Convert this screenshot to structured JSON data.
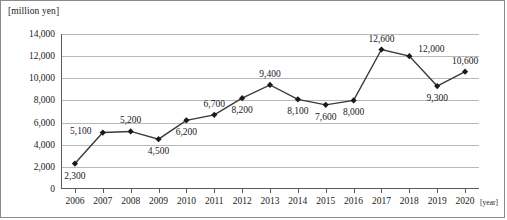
{
  "chart_data": {
    "type": "line",
    "title": "",
    "ylabel": "[million yen]",
    "xlabel": "[year]",
    "categories": [
      "2006",
      "2007",
      "2008",
      "2009",
      "2010",
      "2011",
      "2012",
      "2013",
      "2014",
      "2015",
      "2016",
      "2017",
      "2018",
      "2019",
      "2020"
    ],
    "values": [
      2300,
      5100,
      5200,
      4500,
      6200,
      6700,
      8200,
      9400,
      8100,
      7600,
      8000,
      12600,
      12000,
      9300,
      10600
    ],
    "point_labels": [
      "2,300",
      "5,100",
      "5,200",
      "4,500",
      "6,200",
      "6,700",
      "8,200",
      "9,400",
      "8,100",
      "7,600",
      "8,000",
      "12,600",
      "12,000",
      "9,300",
      "10,600"
    ],
    "label_positions": [
      "below",
      "left",
      "above",
      "below",
      "below",
      "above",
      "below",
      "above",
      "below",
      "below",
      "below",
      "above",
      "right-above",
      "below",
      "above"
    ],
    "ylim": [
      0,
      14000
    ],
    "ytick_values": [
      0,
      2000,
      4000,
      6000,
      8000,
      10000,
      12000,
      14000
    ],
    "ytick_labels": [
      "0",
      "2,000",
      "4,000",
      "6,000",
      "8,000",
      "10,000",
      "12,000",
      "14,000"
    ],
    "grid": "horizontal",
    "legend": "none",
    "marker": "diamond",
    "line_color": "#3a3a3a",
    "marker_color": "#1a1a1a",
    "grid_color": "#b9b9b9",
    "axis_color": "#5a5a5a"
  }
}
